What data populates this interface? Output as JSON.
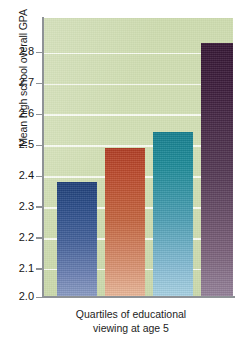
{
  "chart_data": {
    "type": "bar",
    "title": "",
    "subtitle": "",
    "xlabel": "Quartiles of educational viewing at age 5",
    "xlabel_line1": "Quartiles of educational",
    "xlabel_line2": "viewing at age 5",
    "ylabel": "Mean high school overall GPA",
    "categories": [
      "1",
      "2",
      "3",
      "4"
    ],
    "values": [
      2.37,
      2.48,
      2.53,
      2.82
    ],
    "ylim": [
      2.0,
      2.9
    ],
    "yticks": [
      2.0,
      2.1,
      2.2,
      2.3,
      2.4,
      2.5,
      2.6,
      2.7,
      2.8
    ],
    "ytick_labels": [
      "2.0",
      "2.1",
      "2.2",
      "2.3",
      "2.4",
      "2.5",
      "2.6",
      "2.7",
      "2.8"
    ],
    "xtick_labels": [
      "",
      "",
      "",
      ""
    ],
    "grid": "horizontal",
    "legend": "none",
    "bar_colors": [
      "#2a4c88",
      "#bc4b2d",
      "#1d8b99",
      "#3d1d3c"
    ],
    "plot_background": "#cfdcb1",
    "gridline_color": "#fbfdf6",
    "axis_color": "#8e9296",
    "series": [
      {
        "name": "Mean high school overall GPA",
        "values": [
          2.37,
          2.48,
          2.53,
          2.82
        ]
      }
    ]
  }
}
